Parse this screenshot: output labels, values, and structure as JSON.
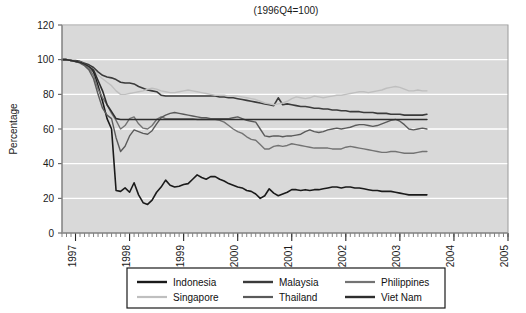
{
  "chart_data": {
    "type": "line",
    "title": "(1996Q4=100)",
    "xlabel": "",
    "ylabel": "Percentage",
    "ylim": [
      0,
      120
    ],
    "yticks": [
      0,
      20,
      40,
      60,
      80,
      100,
      120
    ],
    "xlim": [
      1996.75,
      2005.0
    ],
    "xticks": [
      1997,
      1998,
      1999,
      2000,
      2001,
      2002,
      2003,
      2004,
      2005
    ],
    "xtick_labels": [
      "1997",
      "1998",
      "1999",
      "2000",
      "2001",
      "2002",
      "2003",
      "2004",
      "2005"
    ],
    "xtick_rotation": 90,
    "grid": "horizontal-white",
    "plot_background": "#d9d9d9",
    "legend_position": "below-plot",
    "legend_columns": 3,
    "x_start": 1996.75,
    "x_step": 0.0833333,
    "series": [
      {
        "name": "Indonesia",
        "color": "#1a1a1a",
        "width": 1.6,
        "values": [
          100,
          100,
          99.5,
          99,
          98.5,
          97.5,
          96,
          93,
          85,
          76,
          66,
          60,
          24.5,
          24,
          26,
          23.5,
          29,
          22,
          17.5,
          16.5,
          19,
          23.5,
          26.5,
          30.5,
          27.5,
          26.5,
          27,
          28,
          28.5,
          31,
          33.5,
          32,
          31,
          32.5,
          32.5,
          31,
          30,
          28.5,
          27.5,
          26.5,
          26,
          24.5,
          24,
          22.5,
          20,
          21.5,
          25.5,
          23,
          21.5,
          22.5,
          23.5,
          25,
          25,
          24.5,
          25,
          24.5,
          25,
          25,
          25.5,
          26,
          26.5,
          26.5,
          26,
          26.5,
          26.5,
          26,
          26,
          25.5,
          25,
          24.5,
          24.5,
          24,
          24,
          24,
          23.5,
          23,
          22.5,
          22,
          22,
          22,
          22,
          22
        ]
      },
      {
        "name": "Malaysia",
        "color": "#3b3b3b",
        "width": 1.6,
        "values": [
          100,
          100,
          99.5,
          99.5,
          99,
          98,
          97,
          95.5,
          93,
          91,
          90,
          89.5,
          88.5,
          87,
          86.5,
          86.5,
          86,
          84.5,
          83.5,
          82.5,
          82,
          81.5,
          79.5,
          79,
          79,
          79,
          79,
          79,
          79,
          79,
          79,
          79,
          79,
          79,
          79,
          78.5,
          78.5,
          78,
          78,
          77.5,
          77,
          76.5,
          76,
          75.5,
          75,
          74.5,
          74,
          73.5,
          78,
          74,
          74.5,
          74,
          73.5,
          73,
          73,
          72.5,
          72,
          72,
          71.5,
          71.5,
          71,
          71,
          70.5,
          70.5,
          70,
          70,
          70,
          69.5,
          69.5,
          69.5,
          69,
          69,
          69,
          68.5,
          68.5,
          68.5,
          68,
          68,
          68,
          68,
          68,
          68.5
        ]
      },
      {
        "name": "Philippines",
        "color": "#737373",
        "width": 1.4,
        "values": [
          100,
          100,
          99.5,
          99,
          98.5,
          97,
          95,
          91,
          83,
          78,
          74,
          69,
          65,
          60,
          62,
          66,
          67,
          63,
          60.5,
          60,
          62,
          65.5,
          67,
          66,
          66,
          66,
          66,
          66,
          66,
          66,
          65.5,
          65.5,
          65.5,
          65.5,
          65.5,
          65,
          64,
          62,
          60,
          58.5,
          57.5,
          55.5,
          54,
          53.5,
          51,
          48.5,
          48.5,
          50,
          50.5,
          50,
          50.5,
          51.5,
          51,
          50.5,
          50,
          49.5,
          49,
          49,
          49,
          49,
          48.5,
          48.5,
          48.5,
          49.5,
          50,
          49.5,
          49,
          48.5,
          48,
          47.5,
          47,
          46.5,
          46.5,
          47,
          47,
          46.5,
          46,
          46,
          46,
          46.5,
          47,
          47
        ]
      },
      {
        "name": "Singapore",
        "color": "#bfbfbf",
        "width": 1.4,
        "values": [
          100,
          100,
          99.5,
          99,
          98.5,
          97.5,
          96,
          94,
          91,
          89,
          87,
          85,
          82,
          80,
          80,
          80.5,
          81,
          81.5,
          82,
          83,
          83.5,
          83,
          82,
          81.5,
          81,
          81,
          81.5,
          82,
          82.5,
          82,
          81.5,
          81,
          80.5,
          80,
          79.5,
          79.5,
          79.5,
          79,
          79,
          79,
          78.5,
          78,
          77.5,
          77,
          76,
          75,
          74.5,
          74,
          74.5,
          75,
          76,
          77.5,
          78.5,
          78,
          77.5,
          78,
          79,
          78.5,
          78,
          78.5,
          79,
          79.5,
          79.5,
          80,
          80.5,
          81,
          81.5,
          81.5,
          81,
          81.5,
          82,
          82.5,
          83.5,
          84,
          84.5,
          84,
          83,
          82,
          82,
          82.5,
          82,
          82
        ]
      },
      {
        "name": "Thailand",
        "color": "#5a5a5a",
        "width": 1.4,
        "values": [
          100,
          100,
          99.5,
          99,
          98,
          96.5,
          94,
          89,
          80,
          72,
          68,
          66,
          55,
          47,
          50,
          56,
          59.5,
          58.5,
          57.5,
          57,
          59,
          63,
          66.5,
          68,
          69,
          69.5,
          69,
          68.5,
          68,
          67.5,
          67,
          66.5,
          66.5,
          66,
          66,
          66,
          66,
          66,
          66.5,
          67,
          66,
          65,
          64.5,
          64,
          60,
          56,
          55.5,
          56,
          56,
          55.5,
          56,
          56,
          56.5,
          57,
          58.5,
          59.5,
          58.5,
          58,
          58.5,
          59.5,
          60,
          60.5,
          60,
          60.5,
          61,
          62,
          62.5,
          62.5,
          62,
          61.5,
          62,
          63,
          64,
          65,
          65.5,
          64.5,
          62.5,
          60,
          59.5,
          60,
          60.5,
          60
        ]
      },
      {
        "name": "Viet Nam",
        "color": "#2e2e2e",
        "width": 1.6,
        "values": [
          100,
          100,
          99.5,
          99,
          98.5,
          97.5,
          96,
          94,
          88,
          82,
          74,
          70,
          66,
          65.5,
          65.5,
          65.5,
          65.5,
          65.5,
          65.5,
          65.5,
          65.5,
          65.5,
          65.5,
          65.5,
          65.5,
          65.5,
          65.5,
          65.5,
          65.5,
          65.5,
          65.5,
          65.5,
          65.5,
          65.5,
          65.5,
          65.5,
          65.5,
          65.5,
          65.5,
          65.5,
          65.5,
          65.5,
          65.5,
          65.5,
          65.5,
          65.5,
          65.5,
          65.5,
          65.5,
          65.5,
          65.5,
          65.5,
          65.5,
          65.5,
          65.5,
          65.5,
          65.5,
          65.5,
          65.5,
          65.5,
          65.5,
          65.5,
          65.5,
          65.5,
          65.5,
          65.5,
          65.5,
          65.5,
          65.5,
          65.5,
          65.5,
          65.5,
          65.5,
          65.5,
          65.5,
          65.5,
          65.5,
          65.5,
          65.5,
          65.5,
          65.5,
          65.5
        ]
      }
    ]
  },
  "legend": {
    "entries": [
      {
        "label": "Indonesia"
      },
      {
        "label": "Malaysia"
      },
      {
        "label": "Philippines"
      },
      {
        "label": "Singapore"
      },
      {
        "label": "Thailand"
      },
      {
        "label": "Viet Nam"
      }
    ]
  }
}
